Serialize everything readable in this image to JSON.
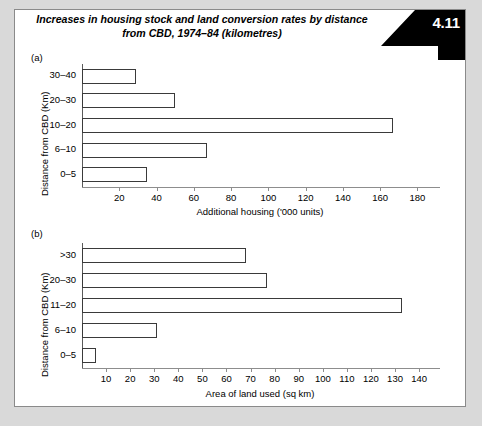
{
  "figure": {
    "title": "Increases in housing stock and land conversion rates by distance from CBD, 1974–84 (kilometres)",
    "badge_number": "4.11",
    "panel_a_label": "(a)",
    "panel_b_label": "(b)"
  },
  "chart_data": [
    {
      "type": "bar",
      "orientation": "horizontal",
      "panel": "(a)",
      "title": "Increases in housing stock and land conversion rates by distance from CBD, 1974–84 (kilometres)",
      "categories": [
        "0–5",
        "6–10",
        "10–20",
        "20–30",
        "30–40"
      ],
      "values": [
        35,
        67,
        167,
        50,
        29
      ],
      "xlabel": "Additional housing ('000 units)",
      "ylabel": "Distance from CBD (Km)",
      "xlim": [
        0,
        190
      ],
      "xticks": [
        20,
        40,
        60,
        80,
        100,
        120,
        140,
        160,
        180
      ],
      "grid": false,
      "legend": false
    },
    {
      "type": "bar",
      "orientation": "horizontal",
      "panel": "(b)",
      "categories": [
        "0–5",
        "6–10",
        "11–20",
        "20–30",
        ">30"
      ],
      "values": [
        6,
        31,
        133,
        77,
        68
      ],
      "xlabel": "Area of land used (sq km)",
      "ylabel": "Distance from CBD (Km)",
      "xlim": [
        0,
        147
      ],
      "xticks": [
        10,
        20,
        30,
        40,
        50,
        60,
        70,
        80,
        90,
        100,
        110,
        120,
        130,
        140
      ],
      "grid": false,
      "legend": false
    }
  ]
}
